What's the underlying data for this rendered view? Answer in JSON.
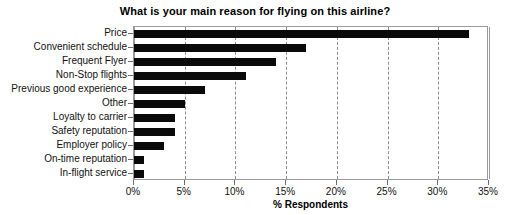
{
  "chart_data": {
    "type": "bar",
    "orientation": "horizontal",
    "title": "What is your main reason for flying on this airline?",
    "xlabel": "% Respondents",
    "ylabel": "",
    "xlim": [
      0,
      35
    ],
    "xticks": [
      0,
      5,
      10,
      15,
      20,
      25,
      30,
      35
    ],
    "xticklabels": [
      "0%",
      "5%",
      "10%",
      "15%",
      "20%",
      "25%",
      "30%",
      "35%"
    ],
    "grid": "vertical-dashed",
    "legend": "none",
    "bar_color": "#0a0a0a",
    "categories": [
      "Price",
      "Convenient schedule",
      "Frequent Flyer",
      "Non-Stop flights",
      "Previous good experience",
      "Other",
      "Loyalty to carrier",
      "Safety reputation",
      "Employer policy",
      "On-time reputation",
      "In-flight service"
    ],
    "values": [
      33,
      17,
      14,
      11,
      7,
      5,
      4,
      4,
      3,
      1,
      1
    ]
  }
}
